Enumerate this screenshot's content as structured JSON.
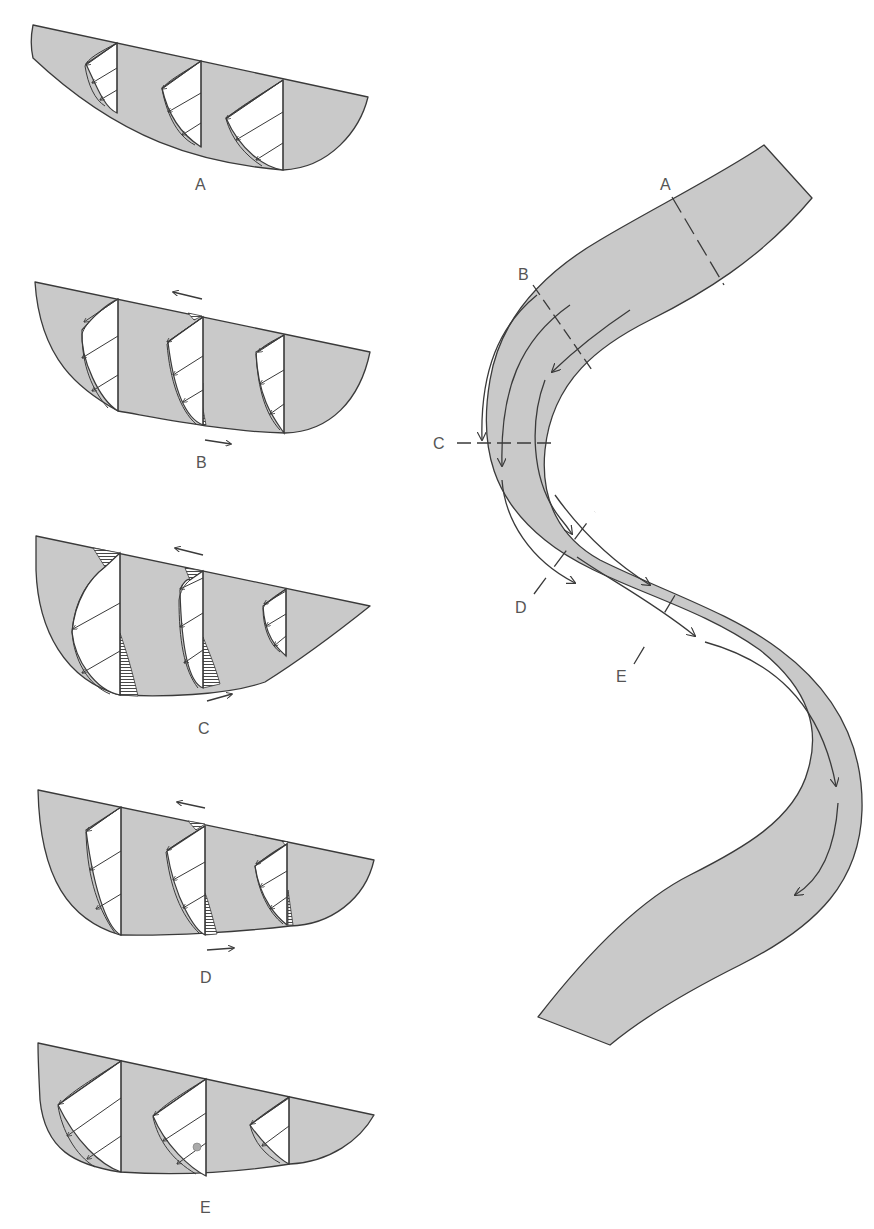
{
  "figure": {
    "colors": {
      "channel_fill": "#c9c9c9",
      "outline": "#3a3a3a",
      "label": "#555555"
    }
  },
  "sections": [
    {
      "id": "A",
      "label": "A",
      "secondary_flow": false
    },
    {
      "id": "B",
      "label": "B",
      "secondary_flow": true
    },
    {
      "id": "C",
      "label": "C",
      "secondary_flow": true
    },
    {
      "id": "D",
      "label": "D",
      "secondary_flow": true
    },
    {
      "id": "E",
      "label": "E",
      "secondary_flow": false
    }
  ],
  "plan_view": {
    "cross_section_labels": [
      "A",
      "B",
      "C",
      "D",
      "E"
    ],
    "icons": [
      "flow-arrow",
      "cross-section-line"
    ]
  }
}
